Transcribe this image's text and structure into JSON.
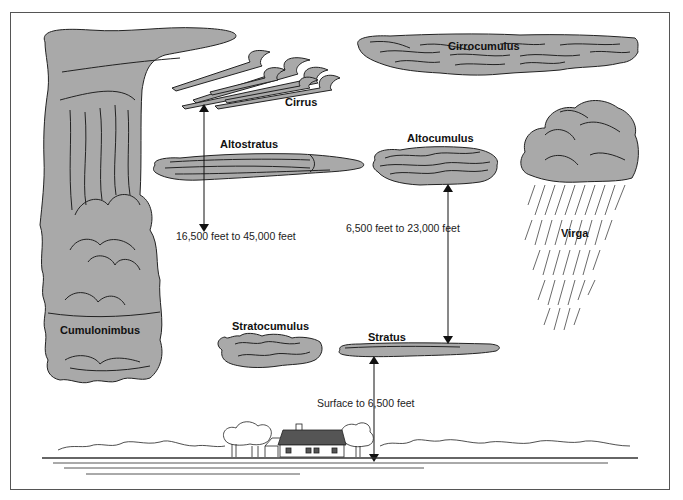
{
  "diagram": {
    "type": "cloud-types-by-altitude",
    "colors": {
      "cloud_fill": "#a9a9a9",
      "outline": "#222222",
      "roof": "#555555",
      "frame": "#555555",
      "background": "#ffffff"
    },
    "clouds": [
      {
        "name": "Cumulonimbus"
      },
      {
        "name": "Cirrus"
      },
      {
        "name": "Cirrocumulus"
      },
      {
        "name": "Altostratus"
      },
      {
        "name": "Altocumulus"
      },
      {
        "name": "Virga"
      },
      {
        "name": "Stratocumulus"
      },
      {
        "name": "Stratus"
      }
    ],
    "altitude_ranges": [
      {
        "label": "16,500 feet to 45,000 feet"
      },
      {
        "label": "6,500 feet to 23,000 feet"
      },
      {
        "label": "Surface to 6,500 feet"
      }
    ],
    "ground": {
      "features": [
        "house",
        "trees",
        "horizon"
      ]
    }
  }
}
